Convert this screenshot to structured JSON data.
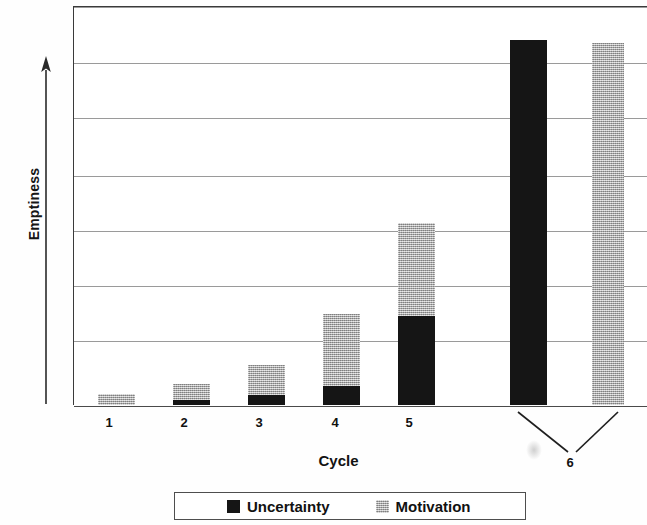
{
  "chart_data": {
    "type": "bar",
    "subtype": "stacked",
    "title": "",
    "xlabel": "Cycle",
    "ylabel": "Emptiness",
    "categories": [
      "1",
      "2",
      "3",
      "4",
      "5",
      "6"
    ],
    "series": [
      {
        "name": "Uncertainty",
        "color": "#151515",
        "values": [
          0,
          5,
          10,
          19,
          89,
          365
        ]
      },
      {
        "name": "Motivation",
        "color": "#b4b4b4",
        "values": [
          11,
          16,
          30,
          72,
          93,
          362
        ]
      }
    ],
    "grid": true,
    "gridlines": 7,
    "legend_position": "bottom",
    "ylim": [
      0,
      399
    ],
    "y_tick_labels": []
  },
  "axes": {
    "y_title": "Emptiness",
    "y_arrow_icon": "up-arrow-icon",
    "x_title": "Cycle",
    "x_tick_labels": [
      "1",
      "2",
      "3",
      "4",
      "5"
    ],
    "x_tick_label_grouped": "6"
  },
  "legend": {
    "entries": [
      {
        "label": "Uncertainty",
        "swatch": "black-square-swatch",
        "color": "#151515"
      },
      {
        "label": "Motivation",
        "swatch": "gray-stipple-swatch",
        "color": "#b4b4b4"
      }
    ]
  },
  "geometry": {
    "gridline_tops": [
      0,
      56,
      111,
      169,
      224,
      279,
      334,
      399
    ],
    "bars": [
      {
        "cycle": "1",
        "left": 24,
        "width": 37,
        "uncertainty": 0,
        "motivation": 11,
        "tick_x": 109
      },
      {
        "cycle": "2",
        "left": 99,
        "width": 37,
        "uncertainty": 5,
        "motivation": 16,
        "tick_x": 184
      },
      {
        "cycle": "3",
        "left": 174,
        "width": 37,
        "uncertainty": 10,
        "motivation": 30,
        "tick_x": 259
      },
      {
        "cycle": "4",
        "left": 249,
        "width": 37,
        "uncertainty": 19,
        "motivation": 72,
        "tick_x": 335
      },
      {
        "cycle": "5",
        "left": 324,
        "width": 37,
        "uncertainty": 89,
        "motivation": 93,
        "tick_x": 409
      },
      {
        "cycle": "6a",
        "left": 436,
        "width": 37,
        "uncertainty": 365,
        "motivation": 0,
        "tick_x": null
      },
      {
        "cycle": "6b",
        "left": 518,
        "width": 32,
        "uncertainty": 0,
        "motivation": 362,
        "tick_x": null
      }
    ]
  }
}
